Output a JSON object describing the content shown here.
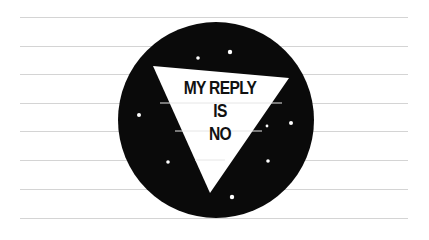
{
  "answer": {
    "lines": [
      "MY REPLY",
      "IS",
      "NO"
    ]
  },
  "colors": {
    "ball": "#0a0a0a",
    "window": "#ffffff",
    "rule": "#d4d4d4",
    "paper": "#ffffff"
  },
  "ruled_lines_y": [
    17,
    46,
    74,
    103,
    131,
    160,
    189,
    218
  ],
  "ball": {
    "cx": 216,
    "cy": 120,
    "r": 96
  },
  "triangle": {
    "points": "153,66 289,78 210,193"
  },
  "sparkles": [
    {
      "x": 198,
      "y": 58,
      "r": 1.8
    },
    {
      "x": 230,
      "y": 52,
      "r": 2.2
    },
    {
      "x": 139,
      "y": 115,
      "r": 2
    },
    {
      "x": 267,
      "y": 126,
      "r": 1.4
    },
    {
      "x": 291,
      "y": 123,
      "r": 2
    },
    {
      "x": 268,
      "y": 161,
      "r": 1.8
    },
    {
      "x": 168,
      "y": 162,
      "r": 1.8
    },
    {
      "x": 232,
      "y": 197,
      "r": 2.2
    }
  ]
}
